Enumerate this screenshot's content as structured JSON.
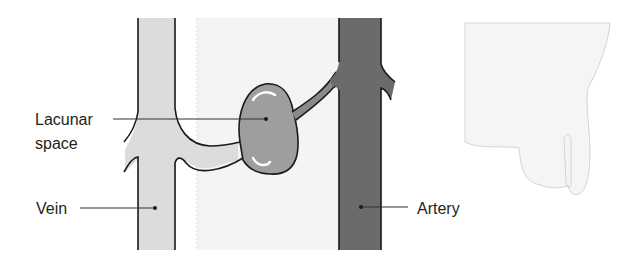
{
  "figure": {
    "type": "anatomical-schematic",
    "labels": {
      "lacunar_line1": "Lacunar",
      "lacunar_line2": "space",
      "vein": "Vein",
      "artery": "Artery"
    },
    "colors": {
      "vein_fill": "#dcdcdc",
      "artery_fill": "#6b6b6b",
      "lacunar_fill": "#9e9e9e",
      "branch_fill": "#bdbdbd",
      "panel_fill": "#f4f4f4",
      "outline": "#1a1a1a",
      "faint_shape_fill": "#f5f5f5",
      "faint_shape_stroke": "#d4d4d4",
      "leader_line": "#333333"
    }
  }
}
